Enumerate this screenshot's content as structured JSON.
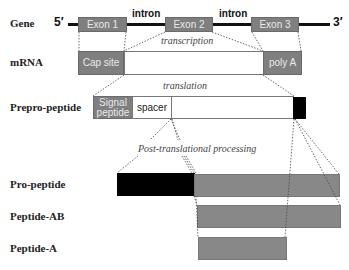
{
  "rows": {
    "gene": "Gene",
    "mrna": "mRNA",
    "prepro": "Prepro-peptide",
    "pro": "Pro-peptide",
    "peptide_ab": "Peptide-AB",
    "peptide_a": "Peptide-A"
  },
  "gene": {
    "five_prime": "5′",
    "three_prime": "3′",
    "exons": [
      "Exon 1",
      "Exon 2",
      "Exon 3"
    ],
    "introns": [
      "intron",
      "intron"
    ]
  },
  "steps": {
    "transcription": "transcription",
    "translation": "translation",
    "processing": "Post-translational processing"
  },
  "mrna": {
    "cap": "Cap site",
    "polya": "poly A"
  },
  "prepro": {
    "signal_line1": "Signal",
    "signal_line2": "peptide",
    "spacer": "spacer"
  },
  "colors": {
    "exon_gray": "#7f7f7f",
    "peptide_gray": "#888888",
    "black": "#000000"
  }
}
